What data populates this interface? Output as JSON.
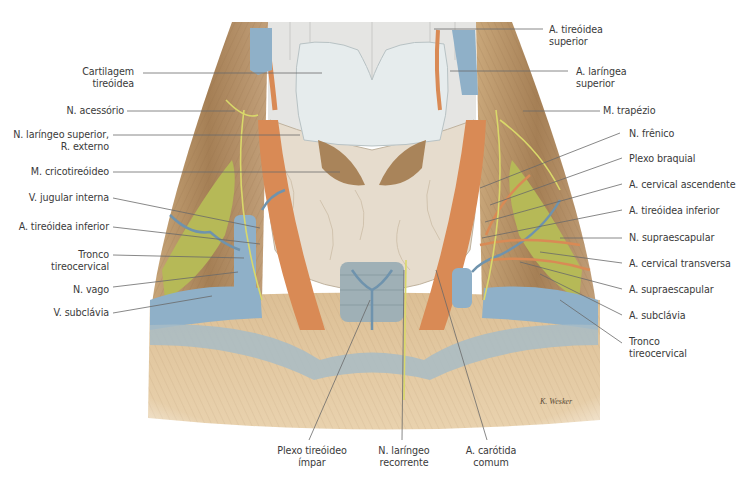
{
  "figure": {
    "type": "anatomical illustration",
    "signature": "K. Wesker",
    "colors": {
      "muscle": "#b8946a",
      "muscle_dark": "#8c6a45",
      "artery": "#d98a55",
      "vein": "#8fb0c8",
      "nerve": "#d9d86a",
      "thyroid": "#e6ddd0",
      "cartilage": "#e8eeee",
      "scalene": "#b5b85a",
      "leader_line": "#6a6a6a"
    }
  },
  "labels_left": [
    {
      "lines": [
        "Cartilagem",
        "tireóidea"
      ]
    },
    {
      "lines": [
        "N. acessório"
      ]
    },
    {
      "lines": [
        "N. laríngeo superior,",
        "R. externo"
      ]
    },
    {
      "lines": [
        "M. cricotireóideo"
      ]
    },
    {
      "lines": [
        "V. jugular interna"
      ]
    },
    {
      "lines": [
        "A. tireóidea inferior"
      ]
    },
    {
      "lines": [
        "Tronco",
        "tireocervical"
      ]
    },
    {
      "lines": [
        "N. vago"
      ]
    },
    {
      "lines": [
        "V. subclávia"
      ]
    }
  ],
  "labels_right": [
    {
      "lines": [
        "A. tireóidea",
        "superior"
      ]
    },
    {
      "lines": [
        "A. laríngea",
        "superior"
      ]
    },
    {
      "lines": [
        "M. trapézio"
      ]
    },
    {
      "lines": [
        "N. frênico"
      ]
    },
    {
      "lines": [
        "Plexo braquial"
      ]
    },
    {
      "lines": [
        "A. cervical ascendente"
      ]
    },
    {
      "lines": [
        "A. tireóidea inferior"
      ]
    },
    {
      "lines": [
        "N. supraescapular"
      ]
    },
    {
      "lines": [
        "A. cervical transversa"
      ]
    },
    {
      "lines": [
        "A. supraescapular"
      ]
    },
    {
      "lines": [
        "A. subclávia"
      ]
    },
    {
      "lines": [
        "Tronco",
        "tireocervical"
      ]
    }
  ],
  "labels_bottom": [
    {
      "lines": [
        "Plexo tireóideo",
        "ímpar"
      ]
    },
    {
      "lines": [
        "N. laríngeo",
        "recorrente"
      ]
    },
    {
      "lines": [
        "A. carótida",
        "comum"
      ]
    }
  ]
}
